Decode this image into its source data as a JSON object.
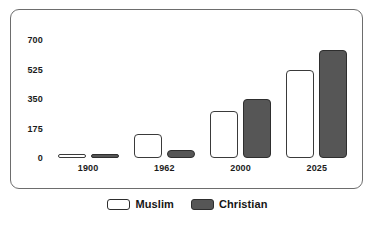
{
  "chart_data": {
    "type": "bar",
    "title": "",
    "subtitle": "",
    "xlabel": "",
    "ylabel": "",
    "categories": [
      "1900",
      "1962",
      "2000",
      "2025"
    ],
    "series": [
      {
        "name": "Muslim",
        "color": "#ffffff",
        "values": [
          10,
          140,
          280,
          525
        ]
      },
      {
        "name": "Christian",
        "color": "#565656",
        "values": [
          5,
          45,
          350,
          640
        ]
      }
    ],
    "ylim": [
      0,
      700
    ],
    "yticks": [
      0,
      175,
      350,
      525,
      700
    ],
    "ytick_labels": [
      "0",
      "175",
      "350",
      "525",
      "700"
    ],
    "grid": false,
    "legend_position": "bottom",
    "frame_color": "#6d6d6d",
    "text_color": "#1b1b1b"
  },
  "legend": {
    "entries": [
      {
        "label": "Muslim",
        "swatch": "white-swatch-icon"
      },
      {
        "label": "Christian",
        "swatch": "dark-swatch-icon"
      }
    ]
  }
}
